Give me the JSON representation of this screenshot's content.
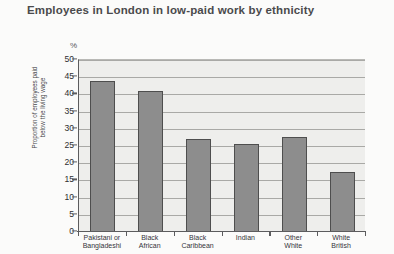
{
  "chart_data": {
    "type": "bar",
    "title": "Employees in London in low-paid work by ethnicity",
    "xlabel": "",
    "ylabel": "Proportion of employees paid below the living wage",
    "ylabel_lines": [
      "Proportion of employees paid",
      "below the living wage"
    ],
    "unit_marker": "%",
    "categories": [
      "Pakistani or Bangladeshi",
      "Black African",
      "Black Caribbean",
      "Indian",
      "Other White",
      "White British"
    ],
    "category_lines": [
      [
        "Pakistani or",
        "Bangladeshi"
      ],
      [
        "Black",
        "African"
      ],
      [
        "Black",
        "Caribbean"
      ],
      [
        "Indian",
        ""
      ],
      [
        "Other",
        "White"
      ],
      [
        "White",
        "British"
      ]
    ],
    "values": [
      44,
      41,
      27,
      25.5,
      27.5,
      17.5
    ],
    "ylim": [
      0,
      50
    ],
    "ytick_step": 5,
    "yticks": [
      0,
      5,
      10,
      15,
      20,
      25,
      30,
      35,
      40,
      45,
      50
    ],
    "ytick_labels": [
      "0",
      "5",
      "10",
      "15",
      "20",
      "25",
      "30",
      "35",
      "40",
      "45",
      "50"
    ],
    "grid": true,
    "legend": false,
    "colors": {
      "bar_fill": "#8d8d8d",
      "bar_outline": "#4e4e4e",
      "plot_background": "#eeeeec",
      "gridline": "#a9a9a6",
      "axis": "#5c5c5e",
      "title_text": "#4a4a4c",
      "tick_text": "#2f2f31",
      "page_background": "#fbfbfa"
    }
  }
}
